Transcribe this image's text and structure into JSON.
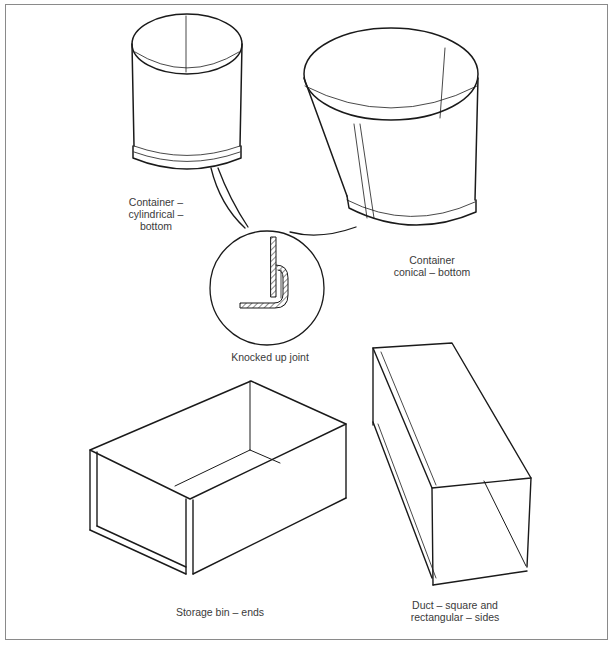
{
  "figure": {
    "labels": {
      "cylindrical": [
        "Container –",
        "cylindrical –",
        "bottom"
      ],
      "conical": [
        "Container",
        "conical – bottom"
      ],
      "joint": "Knocked up joint",
      "storage_bin": "Storage bin – ends",
      "duct": [
        "Duct – square and",
        "rectangular – sides"
      ]
    },
    "colors": {
      "line": "#1a1a1a",
      "frame": "#8a8a8a",
      "background": "#ffffff"
    }
  }
}
